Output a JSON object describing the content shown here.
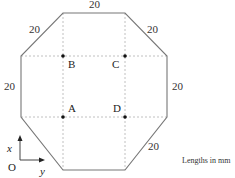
{
  "diagram": {
    "shape": "octagon",
    "edge_labels": {
      "top": "20",
      "top_left": "20",
      "top_right": "20",
      "left": "20",
      "right": "20",
      "bottom_right": "20"
    },
    "points": {
      "A": "A",
      "B": "B",
      "C": "C",
      "D": "D"
    },
    "axes": {
      "origin": "O",
      "x_label": "x",
      "y_label": "y"
    },
    "units_note": "Lengths in mm",
    "colors": {
      "outline": "#777777",
      "dashed": "#aaaaaa",
      "dot": "#111111"
    }
  }
}
